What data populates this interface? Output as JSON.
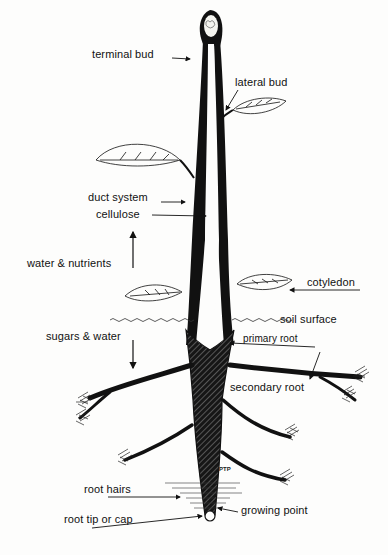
{
  "diagram": {
    "labels": {
      "terminal_bud": "terminal bud",
      "lateral_bud": "lateral bud",
      "duct_system": "duct system",
      "cellulose": "cellulose",
      "water_nutrients": "water & nutrients",
      "cotyledon": "cotyledon",
      "soil_surface": "soil surface",
      "sugars_water": "sugars & water",
      "primary_root": "primary root",
      "secondary_root": "secondary root",
      "root_hairs": "root hairs",
      "root_tip": "root tip or cap",
      "growing_point": "growing point"
    },
    "signature": "PTP",
    "arrows": {
      "water_nutrients_direction": "up",
      "sugars_water_direction": "down"
    },
    "colors": {
      "ink": "#111111",
      "paper": "#fdfdfc"
    }
  }
}
